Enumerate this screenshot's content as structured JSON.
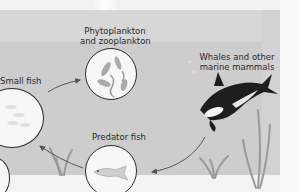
{
  "diagram": {
    "nodes": [
      {
        "id": "plankton",
        "label_line1": "Phytoplankton",
        "label_line2": "and zooplankton"
      },
      {
        "id": "whales",
        "label_line1": "Whales and other",
        "label_line2": "marine mammals"
      },
      {
        "id": "predator",
        "label": "Predator fish"
      },
      {
        "id": "small",
        "label": "Small fish"
      }
    ],
    "edges": [
      {
        "from": "small",
        "to": "plankton"
      },
      {
        "from": "whales",
        "to": "predator"
      },
      {
        "from": "predator",
        "to": "small"
      }
    ],
    "colors": {
      "background": "#cdcdcd",
      "circle_fill": "#f7f7f7",
      "circle_border": "#2b2b2b",
      "arrow": "#555555",
      "text": "#2a2a2a"
    }
  }
}
